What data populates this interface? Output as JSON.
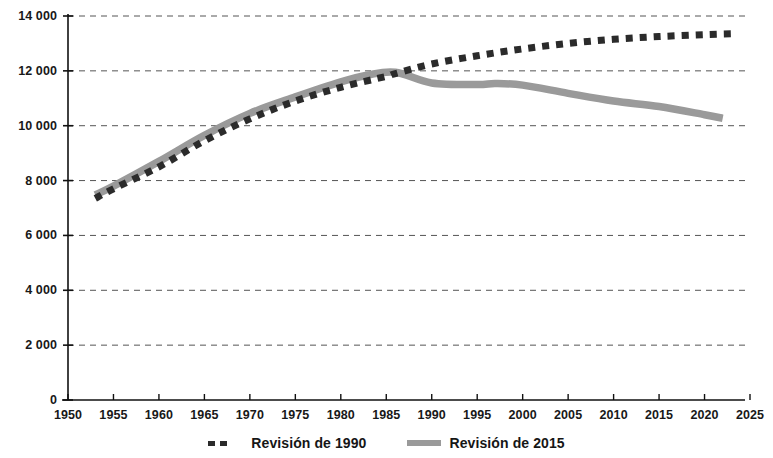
{
  "chart_data": {
    "type": "line",
    "title": "",
    "subtitle": "",
    "xlabel": "",
    "ylabel": "",
    "xlim": [
      1950,
      2025
    ],
    "ylim": [
      0,
      14000
    ],
    "grid": true,
    "grid_axis": "y",
    "legend_position": "bottom",
    "x_ticks": [
      1950,
      1955,
      1960,
      1965,
      1970,
      1975,
      1980,
      1985,
      1990,
      1995,
      2000,
      2005,
      2010,
      2015,
      2020,
      2025
    ],
    "x_tick_labels": [
      "1950",
      "1955",
      "1960",
      "1965",
      "1970",
      "1975",
      "1980",
      "1985",
      "1990",
      "1995",
      "2000",
      "2005",
      "2010",
      "2015",
      "2020",
      "2025"
    ],
    "y_ticks": [
      0,
      2000,
      4000,
      6000,
      8000,
      10000,
      12000,
      14000
    ],
    "y_tick_labels": [
      "0",
      "2 000",
      "4 000",
      "6 000",
      "8 000",
      "10 000",
      "12 000",
      "14 000"
    ],
    "series": [
      {
        "name": "Revisión de 1990",
        "style": "dashed",
        "color": "#2b2b2b",
        "x": [
          1953,
          1955,
          1960,
          1965,
          1970,
          1975,
          1980,
          1985,
          1986,
          1990,
          1995,
          2000,
          2005,
          2010,
          2015,
          2020,
          2023
        ],
        "values": [
          7350,
          7700,
          8500,
          9450,
          10250,
          10900,
          11400,
          11800,
          11900,
          12250,
          12550,
          12800,
          13000,
          13150,
          13250,
          13320,
          13350
        ]
      },
      {
        "name": "Revisión de 2015",
        "style": "solid",
        "color": "#9a9a9a",
        "x": [
          1953,
          1955,
          1960,
          1965,
          1970,
          1975,
          1980,
          1983,
          1986,
          1990,
          1995,
          1997,
          2000,
          2005,
          2010,
          2015,
          2020,
          2022
        ],
        "values": [
          7480,
          7800,
          8700,
          9650,
          10450,
          11050,
          11600,
          11850,
          11950,
          11560,
          11500,
          11540,
          11480,
          11180,
          10900,
          10700,
          10400,
          10270
        ]
      }
    ]
  },
  "legend": {
    "items": [
      {
        "label": "Revisión de 1990",
        "marker": "dashed-line-marker",
        "color": "#2b2b2b"
      },
      {
        "label": "Revisión de 2015",
        "marker": "solid-line-marker",
        "color": "#9a9a9a"
      }
    ]
  },
  "colors": {
    "series_1990": "#2b2b2b",
    "series_2015": "#9a9a9a",
    "axis": "#111111",
    "grid": "#555555",
    "background": "#ffffff"
  }
}
